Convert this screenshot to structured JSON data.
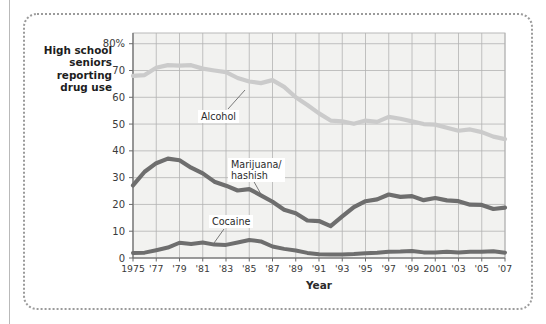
{
  "caption": {
    "text": "High school seniors reporting drug use"
  },
  "chart_data": {
    "type": "line",
    "title": "",
    "subtitle": "",
    "xlabel": "Year",
    "ylabel": "High school seniors reporting drug use",
    "grid": true,
    "legend_position": "inline-annotations",
    "ylim": [
      0,
      84
    ],
    "xlim": [
      1975,
      2007
    ],
    "ytick_values": [
      0,
      10,
      20,
      30,
      40,
      50,
      60,
      70,
      80
    ],
    "ytick_labels": [
      "0",
      "10",
      "20",
      "30",
      "40",
      "50",
      "60",
      "70",
      "80%"
    ],
    "xtick_values": [
      1975,
      1977,
      1979,
      1981,
      1983,
      1985,
      1987,
      1989,
      1991,
      1993,
      1995,
      1997,
      1999,
      2001,
      2003,
      2005,
      2007
    ],
    "xtick_labels": [
      "1975",
      "'77",
      "'79",
      "'81",
      "'83",
      "'85",
      "'87",
      "'89",
      "'91",
      "'93",
      "'95",
      "'97",
      "'99",
      "2001",
      "'03",
      "'05",
      "'07"
    ],
    "x": [
      1975,
      1976,
      1977,
      1978,
      1979,
      1980,
      1981,
      1982,
      1983,
      1984,
      1985,
      1986,
      1987,
      1988,
      1989,
      1990,
      1991,
      1992,
      1993,
      1994,
      1995,
      1996,
      1997,
      1998,
      1999,
      2000,
      2001,
      2002,
      2003,
      2004,
      2005,
      2006,
      2007
    ],
    "series": [
      {
        "name": "Alcohol",
        "color": "#cbcbcb",
        "values": [
          68,
          68.3,
          71,
          72,
          71.8,
          72,
          70.7,
          70,
          69.4,
          67.2,
          65.9,
          65.3,
          66.4,
          63.9,
          60,
          57.1,
          54,
          51.3,
          51,
          50.1,
          51.3,
          50.8,
          52.7,
          52,
          51,
          50,
          49.8,
          48.6,
          47.5,
          48,
          47,
          45.3,
          44.4
        ]
      },
      {
        "name": "Marijuana/\nhashish",
        "color": "#6e6e6e",
        "values": [
          27.1,
          32.2,
          35.4,
          37.1,
          36.5,
          33.7,
          31.6,
          28.5,
          27,
          25.2,
          25.7,
          23.4,
          21,
          18,
          16.7,
          14,
          13.8,
          11.9,
          15.5,
          19,
          21.2,
          21.9,
          23.7,
          22.8,
          23.1,
          21.6,
          22.4,
          21.5,
          21.2,
          19.9,
          19.8,
          18.3,
          18.8
        ]
      },
      {
        "name": "Cocaine",
        "color": "#6e6e6e",
        "values": [
          1.9,
          2,
          2.9,
          3.9,
          5.7,
          5.2,
          5.8,
          5,
          4.9,
          5.8,
          6.7,
          6.2,
          4.3,
          3.4,
          2.8,
          1.9,
          1.4,
          1.3,
          1.3,
          1.5,
          1.8,
          2,
          2.3,
          2.4,
          2.6,
          2.1,
          2.1,
          2.3,
          2.1,
          2.3,
          2.3,
          2.5,
          2
        ]
      }
    ],
    "annotations": [
      {
        "label": "Alcohol",
        "series": "Alcohol"
      },
      {
        "label": "Marijuana/\nhashish",
        "series": "Marijuana/hashish"
      },
      {
        "label": "Cocaine",
        "series": "Cocaine"
      }
    ],
    "colors": {
      "alcohol_line": "#cbcbcb",
      "marijuana_line": "#6e6e6e",
      "cocaine_line": "#6e6e6e",
      "grid": "#b2b2b2",
      "plot_background": "#f2f2f0",
      "frame": "#9b9b9b",
      "text": "#2b2b2b"
    }
  }
}
